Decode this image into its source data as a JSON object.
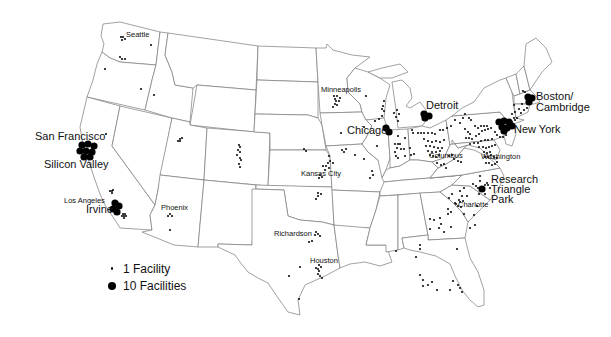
{
  "map": {
    "title": "",
    "subject": "Facility locations, contiguous United States",
    "dot_color": "#000000",
    "border_color": "#7a7a7a",
    "labels": [
      {
        "text": "Seattle",
        "x": 126,
        "y": 37,
        "size": "small"
      },
      {
        "text": "San Francisco",
        "x": 35,
        "y": 140,
        "size": "large"
      },
      {
        "text": "Silicon Valley",
        "x": 44,
        "y": 168,
        "size": "large"
      },
      {
        "text": "Los Angeles",
        "x": 64,
        "y": 203,
        "size": "small"
      },
      {
        "text": "Irvine",
        "x": 86,
        "y": 213,
        "size": "large"
      },
      {
        "text": "Phoenix",
        "x": 161,
        "y": 210,
        "size": "small"
      },
      {
        "text": "Minneapolis",
        "x": 321,
        "y": 92,
        "size": "small"
      },
      {
        "text": "Chicago",
        "x": 347,
        "y": 134,
        "size": "large"
      },
      {
        "text": "Detroit",
        "x": 426,
        "y": 109,
        "size": "large"
      },
      {
        "text": "Kansas City",
        "x": 301,
        "y": 176,
        "size": "small"
      },
      {
        "text": "Richardson",
        "x": 274,
        "y": 236,
        "size": "small"
      },
      {
        "text": "Houston",
        "x": 310,
        "y": 263,
        "size": "small"
      },
      {
        "text": "Columbus",
        "x": 429,
        "y": 158,
        "size": "small"
      },
      {
        "text": "Washington",
        "x": 481,
        "y": 159,
        "size": "small"
      },
      {
        "text": "New York",
        "x": 514,
        "y": 133,
        "size": "large"
      },
      {
        "text": "Boston/",
        "x": 536,
        "y": 100,
        "size": "large"
      },
      {
        "text": "Cambridge",
        "x": 536,
        "y": 111,
        "size": "large"
      },
      {
        "text": "Research",
        "x": 491,
        "y": 183,
        "size": "large"
      },
      {
        "text": "Triangle",
        "x": 491,
        "y": 193,
        "size": "large"
      },
      {
        "text": "Park",
        "x": 491,
        "y": 203,
        "size": "large"
      },
      {
        "text": "Charlotte",
        "x": 458,
        "y": 207,
        "size": "small"
      }
    ],
    "large_dots": [
      [
        82,
        145
      ],
      [
        88,
        144
      ],
      [
        94,
        146
      ],
      [
        80,
        151
      ],
      [
        86,
        151
      ],
      [
        92,
        152
      ],
      [
        84,
        157
      ],
      [
        90,
        157
      ],
      [
        115,
        203
      ],
      [
        119,
        206
      ],
      [
        113,
        209
      ],
      [
        117,
        212
      ],
      [
        386,
        128
      ],
      [
        389,
        132
      ],
      [
        424,
        114
      ],
      [
        429,
        116
      ],
      [
        425,
        118
      ],
      [
        499,
        122
      ],
      [
        504,
        121
      ],
      [
        509,
        122
      ],
      [
        502,
        127
      ],
      [
        507,
        128
      ],
      [
        512,
        126
      ],
      [
        504,
        131
      ],
      [
        528,
        97
      ],
      [
        532,
        98
      ],
      [
        529,
        102
      ],
      [
        482,
        189
      ]
    ],
    "small_dots": [
      [
        121,
        37
      ],
      [
        123,
        37
      ],
      [
        122,
        40
      ],
      [
        125,
        39
      ],
      [
        151,
        45
      ],
      [
        120,
        57
      ],
      [
        122,
        59
      ],
      [
        125,
        59
      ],
      [
        105,
        69
      ],
      [
        141,
        89
      ],
      [
        154,
        95
      ],
      [
        106,
        134
      ],
      [
        180,
        139
      ],
      [
        182,
        138
      ],
      [
        178,
        141
      ],
      [
        180,
        141
      ],
      [
        110,
        191
      ],
      [
        112,
        191
      ],
      [
        113,
        190
      ],
      [
        112,
        193
      ],
      [
        123,
        214
      ],
      [
        125,
        214
      ],
      [
        124,
        216
      ],
      [
        126,
        216
      ],
      [
        122,
        216
      ],
      [
        124,
        218
      ],
      [
        170,
        214
      ],
      [
        172,
        216
      ],
      [
        168,
        216
      ],
      [
        170,
        230
      ],
      [
        239,
        145
      ],
      [
        240,
        147
      ],
      [
        238,
        150
      ],
      [
        240,
        152
      ],
      [
        237,
        155
      ],
      [
        240,
        158
      ],
      [
        241,
        160
      ],
      [
        239,
        164
      ],
      [
        240,
        167
      ],
      [
        334,
        96
      ],
      [
        337,
        96
      ],
      [
        340,
        98
      ],
      [
        335,
        99
      ],
      [
        336,
        101
      ],
      [
        339,
        101
      ],
      [
        335,
        104
      ],
      [
        337,
        105
      ],
      [
        333,
        107
      ],
      [
        366,
        96
      ],
      [
        384,
        101
      ],
      [
        383,
        106
      ],
      [
        382,
        109
      ],
      [
        384,
        111
      ],
      [
        382,
        116
      ],
      [
        379,
        119
      ],
      [
        375,
        121
      ],
      [
        364,
        127
      ],
      [
        341,
        133
      ],
      [
        304,
        149
      ],
      [
        306,
        151
      ],
      [
        329,
        156
      ],
      [
        330,
        161
      ],
      [
        333,
        163
      ],
      [
        328,
        163
      ],
      [
        326,
        166
      ],
      [
        323,
        166
      ],
      [
        329,
        168
      ],
      [
        325,
        170
      ],
      [
        320,
        175
      ],
      [
        322,
        177
      ],
      [
        319,
        178
      ],
      [
        318,
        193
      ],
      [
        321,
        194
      ],
      [
        318,
        196
      ],
      [
        316,
        199
      ],
      [
        316,
        232
      ],
      [
        318,
        234
      ],
      [
        320,
        236
      ],
      [
        315,
        235
      ],
      [
        312,
        241
      ],
      [
        309,
        242
      ],
      [
        300,
        267
      ],
      [
        319,
        265
      ],
      [
        321,
        267
      ],
      [
        318,
        269
      ],
      [
        316,
        268
      ],
      [
        319,
        271
      ],
      [
        318,
        274
      ],
      [
        320,
        276
      ],
      [
        322,
        278
      ],
      [
        289,
        276
      ],
      [
        299,
        299
      ],
      [
        342,
        150
      ],
      [
        346,
        149
      ],
      [
        344,
        152
      ],
      [
        355,
        155
      ],
      [
        364,
        159
      ],
      [
        372,
        171
      ],
      [
        373,
        175
      ],
      [
        370,
        178
      ],
      [
        394,
        113
      ],
      [
        397,
        110
      ],
      [
        399,
        114
      ],
      [
        396,
        117
      ],
      [
        398,
        121
      ],
      [
        412,
        130
      ],
      [
        413,
        133
      ],
      [
        398,
        136
      ],
      [
        405,
        138
      ],
      [
        395,
        144
      ],
      [
        398,
        144
      ],
      [
        400,
        144
      ],
      [
        397,
        148
      ],
      [
        401,
        149
      ],
      [
        404,
        149
      ],
      [
        410,
        148
      ],
      [
        395,
        152
      ],
      [
        396,
        156
      ],
      [
        398,
        158
      ],
      [
        377,
        146
      ],
      [
        405,
        156
      ],
      [
        411,
        155
      ],
      [
        414,
        154
      ],
      [
        418,
        133
      ],
      [
        421,
        133
      ],
      [
        424,
        133
      ],
      [
        428,
        133
      ],
      [
        432,
        133
      ],
      [
        435,
        134
      ],
      [
        440,
        130
      ],
      [
        443,
        130
      ],
      [
        447,
        128
      ],
      [
        451,
        126
      ],
      [
        424,
        139
      ],
      [
        428,
        141
      ],
      [
        432,
        142
      ],
      [
        436,
        141
      ],
      [
        440,
        142
      ],
      [
        444,
        140
      ],
      [
        426,
        146
      ],
      [
        430,
        146
      ],
      [
        434,
        147
      ],
      [
        438,
        148
      ],
      [
        442,
        148
      ],
      [
        428,
        151
      ],
      [
        432,
        152
      ],
      [
        436,
        152
      ],
      [
        440,
        151
      ],
      [
        430,
        155
      ],
      [
        433,
        156
      ],
      [
        436,
        157
      ],
      [
        439,
        155
      ],
      [
        437,
        163
      ],
      [
        441,
        165
      ],
      [
        444,
        164
      ],
      [
        446,
        168
      ],
      [
        455,
        120
      ],
      [
        460,
        123
      ],
      [
        463,
        118
      ],
      [
        465,
        114
      ],
      [
        469,
        118
      ],
      [
        471,
        120
      ],
      [
        449,
        156
      ],
      [
        452,
        155
      ],
      [
        454,
        159
      ],
      [
        458,
        161
      ],
      [
        461,
        162
      ],
      [
        465,
        129
      ],
      [
        468,
        132
      ],
      [
        470,
        134
      ],
      [
        475,
        126
      ],
      [
        478,
        128
      ],
      [
        481,
        126
      ],
      [
        484,
        126
      ],
      [
        487,
        126
      ],
      [
        466,
        138
      ],
      [
        469,
        138
      ],
      [
        472,
        139
      ],
      [
        476,
        136
      ],
      [
        479,
        134
      ],
      [
        482,
        131
      ],
      [
        485,
        130
      ],
      [
        488,
        129
      ],
      [
        491,
        128
      ],
      [
        470,
        144
      ],
      [
        474,
        143
      ],
      [
        478,
        143
      ],
      [
        481,
        141
      ],
      [
        485,
        140
      ],
      [
        488,
        140
      ],
      [
        492,
        139
      ],
      [
        479,
        147
      ],
      [
        483,
        147
      ],
      [
        486,
        148
      ],
      [
        489,
        147
      ],
      [
        492,
        146
      ],
      [
        495,
        145
      ],
      [
        484,
        152
      ],
      [
        487,
        153
      ],
      [
        490,
        152
      ],
      [
        485,
        157
      ],
      [
        488,
        157
      ],
      [
        491,
        155
      ],
      [
        494,
        157
      ],
      [
        497,
        158
      ],
      [
        486,
        163
      ],
      [
        489,
        163
      ],
      [
        492,
        165
      ],
      [
        495,
        164
      ],
      [
        497,
        162
      ],
      [
        497,
        135
      ],
      [
        500,
        137
      ],
      [
        503,
        137
      ],
      [
        506,
        135
      ],
      [
        495,
        132
      ],
      [
        514,
        105
      ],
      [
        515,
        112
      ],
      [
        521,
        113
      ],
      [
        519,
        109
      ],
      [
        524,
        110
      ],
      [
        527,
        108
      ],
      [
        522,
        104
      ],
      [
        525,
        92
      ],
      [
        523,
        91
      ],
      [
        512,
        114
      ],
      [
        514,
        118
      ],
      [
        512,
        122
      ],
      [
        515,
        120
      ],
      [
        517,
        118
      ],
      [
        480,
        176
      ],
      [
        480,
        181
      ],
      [
        476,
        186
      ],
      [
        478,
        188
      ],
      [
        473,
        184
      ],
      [
        485,
        185
      ],
      [
        487,
        183
      ],
      [
        490,
        188
      ],
      [
        488,
        185
      ],
      [
        485,
        194
      ],
      [
        479,
        194
      ],
      [
        467,
        196
      ],
      [
        464,
        188
      ],
      [
        460,
        191
      ],
      [
        462,
        196
      ],
      [
        459,
        200
      ],
      [
        460,
        202
      ],
      [
        463,
        201
      ],
      [
        456,
        204
      ],
      [
        458,
        206
      ],
      [
        461,
        207
      ],
      [
        455,
        203
      ],
      [
        452,
        194
      ],
      [
        449,
        198
      ],
      [
        448,
        209
      ],
      [
        451,
        212
      ],
      [
        448,
        214
      ],
      [
        464,
        214
      ],
      [
        474,
        215
      ],
      [
        477,
        206
      ],
      [
        475,
        225
      ],
      [
        470,
        228
      ],
      [
        430,
        219
      ],
      [
        434,
        220
      ],
      [
        440,
        218
      ],
      [
        441,
        224
      ],
      [
        451,
        227
      ],
      [
        439,
        228
      ],
      [
        444,
        232
      ],
      [
        430,
        229
      ],
      [
        420,
        245
      ],
      [
        396,
        251
      ],
      [
        420,
        249
      ],
      [
        416,
        257
      ],
      [
        420,
        275
      ],
      [
        423,
        280
      ],
      [
        423,
        286
      ],
      [
        428,
        285
      ],
      [
        432,
        282
      ],
      [
        437,
        290
      ],
      [
        450,
        290
      ],
      [
        453,
        281
      ],
      [
        458,
        285
      ],
      [
        460,
        288
      ],
      [
        462,
        292
      ],
      [
        457,
        249
      ]
    ]
  },
  "legend": {
    "items": [
      {
        "symbol": "small-dot",
        "label": "1 Facility"
      },
      {
        "symbol": "large-dot",
        "label": "10 Facilities"
      }
    ]
  }
}
